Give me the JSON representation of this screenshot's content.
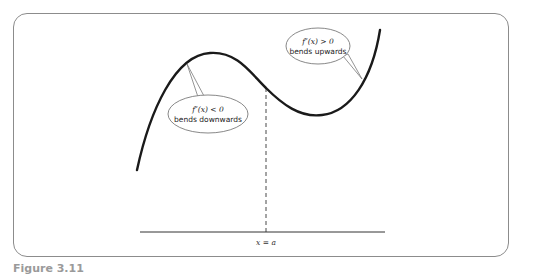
{
  "diagram": {
    "callouts": {
      "concave_down": {
        "condition": "f″(x) < 0",
        "description": "bends downwards"
      },
      "concave_up": {
        "condition": "f″(x) > 0",
        "description": "bends upwards"
      }
    },
    "inflection_label": "x = a",
    "caption": "Figure 3.11",
    "colors": {
      "curve": "#1a1a1a",
      "frame": "#8c8c8c",
      "callout_border": "#7a7a7a",
      "axis": "#333333"
    }
  }
}
